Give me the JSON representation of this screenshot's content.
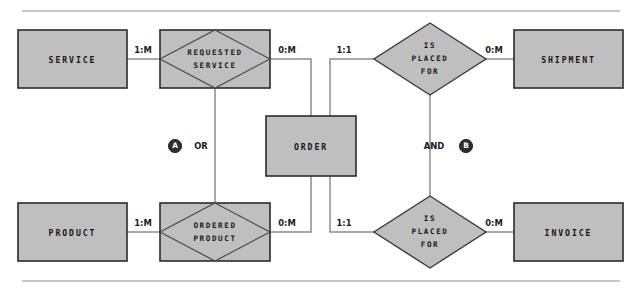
{
  "diagram": {
    "type": "entity-relationship-diagram",
    "entities": [
      {
        "id": "service",
        "label": "SERVICE",
        "x": 18,
        "y": 30,
        "w": 109,
        "h": 58
      },
      {
        "id": "shipment",
        "label": "SHIPMENT",
        "x": 514,
        "y": 30,
        "w": 109,
        "h": 58
      },
      {
        "id": "product",
        "label": "PRODUCT",
        "x": 18,
        "y": 203,
        "w": 109,
        "h": 58
      },
      {
        "id": "invoice",
        "label": "INVOICE",
        "x": 514,
        "y": 203,
        "w": 109,
        "h": 58
      },
      {
        "id": "order",
        "label": "ORDER",
        "x": 266,
        "y": 116,
        "w": 90,
        "h": 60
      }
    ],
    "composite_relationships": [
      {
        "id": "requested-service",
        "lines": [
          "REQUESTED",
          "SERVICE"
        ],
        "x": 160,
        "y": 30,
        "w": 110,
        "h": 58,
        "shape": "diamond-in-rectangle"
      },
      {
        "id": "ordered-product",
        "lines": [
          "ORDERED",
          "PRODUCT"
        ],
        "x": 160,
        "y": 203,
        "w": 110,
        "h": 58,
        "shape": "diamond-in-rectangle"
      }
    ],
    "relationships": [
      {
        "id": "is-placed-for-shipment",
        "lines": [
          "IS",
          "PLACED",
          "FOR"
        ],
        "cx": 430,
        "cy": 59,
        "rx": 56,
        "ry": 36,
        "shape": "diamond"
      },
      {
        "id": "is-placed-for-invoice",
        "lines": [
          "IS",
          "PLACED",
          "FOR"
        ],
        "cx": 430,
        "cy": 232,
        "rx": 56,
        "ry": 36,
        "shape": "diamond"
      }
    ],
    "cardinality_labels": [
      {
        "id": "card-service-reqservice",
        "text": "1:M",
        "x": 143,
        "y": 50
      },
      {
        "id": "card-reqservice-order",
        "text": "0:M",
        "x": 287,
        "y": 50
      },
      {
        "id": "card-order-isplaced-ship",
        "text": "1:1",
        "x": 344,
        "y": 50
      },
      {
        "id": "card-isplaced-shipment",
        "text": "0:M",
        "x": 494,
        "y": 50
      },
      {
        "id": "card-product-ordprod",
        "text": "1:M",
        "x": 143,
        "y": 223
      },
      {
        "id": "card-ordprod-order",
        "text": "0:M",
        "x": 287,
        "y": 223
      },
      {
        "id": "card-order-isplaced-inv",
        "text": "1:1",
        "x": 344,
        "y": 223
      },
      {
        "id": "card-isplaced-invoice",
        "text": "0:M",
        "x": 494,
        "y": 223
      }
    ],
    "operators": [
      {
        "id": "operator-or",
        "text": "OR",
        "badge": "A",
        "badge_x": 175,
        "badge_y": 146,
        "text_x": 201,
        "text_y": 146
      },
      {
        "id": "operator-and",
        "text": "AND",
        "badge": "B",
        "badge_x": 466,
        "badge_y": 146,
        "text_x": 434,
        "text_y": 146
      }
    ],
    "rules": [
      {
        "id": "top-rule",
        "x1": 22,
        "y1": 11,
        "x2": 620,
        "y2": 11
      },
      {
        "id": "bottom-rule",
        "x1": 22,
        "y1": 281,
        "x2": 620,
        "y2": 281
      }
    ],
    "colors": {
      "fill": "#bfbfbf",
      "stroke": "#2b2b2b",
      "connector": "#8c8c8c",
      "rule": "#b4b4b4",
      "badge": "#2e2e2e",
      "text": "#181818",
      "background": "#ffffff"
    }
  }
}
